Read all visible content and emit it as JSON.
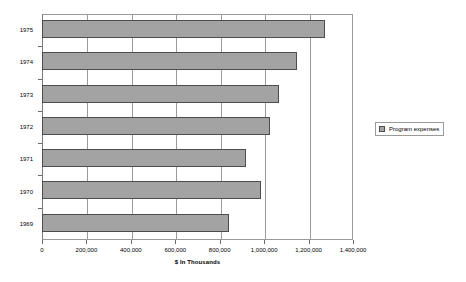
{
  "chart_data": {
    "type": "bar",
    "orientation": "horizontal",
    "title": "",
    "xlabel": "$ In Thousands",
    "ylabel": "",
    "categories": [
      "1969",
      "1970",
      "1971",
      "1972",
      "1973",
      "1974",
      "1975"
    ],
    "series": [
      {
        "name": "Program expenses",
        "values": [
          842000,
          986000,
          918000,
          1026000,
          1067000,
          1148000,
          1274000
        ]
      }
    ],
    "xlim": [
      0,
      1400000
    ],
    "xticks": [
      0,
      200000,
      400000,
      600000,
      800000,
      1000000,
      1200000,
      1400000
    ],
    "xtick_labels": [
      "0",
      "200,000",
      "400,000",
      "600,000",
      "800,000",
      "1,000,000",
      "1,200,000",
      "1,400,000"
    ],
    "grid": "vertical",
    "legend_position": "right",
    "bar_color": "#a3a3a3",
    "bar_border_color": "#4d4d4d",
    "axis_color": "#9a9a9a",
    "background": "#ffffff"
  },
  "legend": {
    "entries": [
      {
        "label": "Program expenses",
        "color": "#a3a3a3"
      }
    ]
  }
}
